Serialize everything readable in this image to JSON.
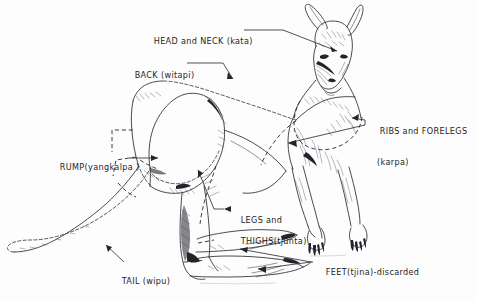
{
  "figure": {
    "kind": "line-drawing-diagram",
    "background_color": "#fdfdfd",
    "ink_color": "#2b2b33",
    "width": 477,
    "height": 302
  },
  "labels": [
    {
      "id": "head-and-neck",
      "english": "HEAD and NECK",
      "vernacular": "kata",
      "text": "HEAD and NECK (kata)",
      "x": 142,
      "y": 26,
      "lines": [
        "HEAD and NECK (kata)"
      ]
    },
    {
      "id": "back",
      "english": "BACK",
      "vernacular": "witapi",
      "text": "BACK (witapi)",
      "x": 123,
      "y": 60,
      "lines": [
        "BACK (witapi)"
      ]
    },
    {
      "id": "ribs-and-forelegs",
      "english": "RIBS and FORELEGS",
      "vernacular": "karpa",
      "text": "RIBS and FORELEGS (karpa)",
      "x": 368,
      "y": 115,
      "lines": [
        "RIBS and FORELEGS",
        "(karpa)"
      ]
    },
    {
      "id": "rump",
      "english": "RUMP",
      "vernacular": "yangkalpa",
      "text": "RUMP(yangkalpa )",
      "x": 48,
      "y": 152,
      "lines": [
        "RUMP(yangkalpa )"
      ]
    },
    {
      "id": "legs-and-thighs",
      "english": "LEGS and THIGHS",
      "vernacular": "tjunta",
      "text": "LEGS and THIGHS(tjunta)",
      "x": 227,
      "y": 204,
      "lines": [
        "LEGS and",
        "THIGHS(tjunta)"
      ]
    },
    {
      "id": "tail",
      "english": "TAIL",
      "vernacular": "wipu",
      "text": "TAIL (wipu)",
      "x": 110,
      "y": 266,
      "lines": [
        "TAIL (wipu)"
      ]
    },
    {
      "id": "feet",
      "english": "FEET",
      "vernacular": "tjina",
      "note": "discarded",
      "text": "FEET(tjina)-discarded",
      "x": 314,
      "y": 263,
      "lines": [
        "FEET(tjina)-discarded"
      ]
    }
  ]
}
